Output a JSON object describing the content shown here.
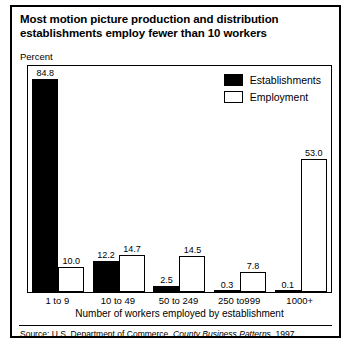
{
  "figure": {
    "title_lines": [
      "Most motion picture production and distribution",
      "establishments employ fewer than 10 workers"
    ],
    "source_prefix": "Source: U.S. Department of Commerce, ",
    "source_italic": "County Business Patterns",
    "source_suffix": ", 1997"
  },
  "chart_data": {
    "type": "bar",
    "title": "Most motion picture production and distribution establishments employ fewer than 10 workers",
    "xlabel": "Number of workers employed by establishment",
    "ylabel": "Percent",
    "ylim": [
      0,
      90
    ],
    "grid": false,
    "legend_position": "top-right",
    "categories": [
      "1 to 9",
      "10 to 49",
      "50 to 249",
      "250 to999",
      "1000+"
    ],
    "series": [
      {
        "name": "Establishments",
        "color": "#000000",
        "fill": "solid",
        "values": [
          84.8,
          12.2,
          2.5,
          0.3,
          0.1
        ],
        "labels": [
          "84.8",
          "12.2",
          "2.5",
          "0.3",
          "0.1"
        ]
      },
      {
        "name": "Employment",
        "color": "#ffffff",
        "fill": "hollow",
        "values": [
          10.0,
          14.7,
          14.5,
          7.8,
          53.0
        ],
        "labels": [
          "10.0",
          "14.7",
          "14.5",
          "7.8",
          "53.0"
        ]
      }
    ]
  }
}
